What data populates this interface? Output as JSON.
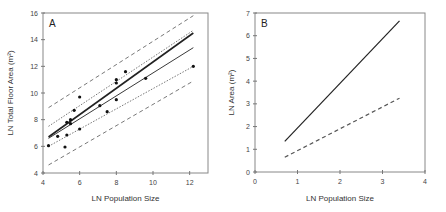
{
  "chart_data": [
    {
      "panel": "A",
      "type": "scatter",
      "title": "",
      "panel_label": "A",
      "xlabel": "LN Population Size",
      "ylabel": "LN Total Floor Area (m²)",
      "xlim": [
        4,
        13
      ],
      "ylim": [
        4,
        16
      ],
      "xticks": [
        4,
        6,
        8,
        10,
        12
      ],
      "yticks": [
        4,
        6,
        8,
        10,
        12,
        14,
        16
      ],
      "grid": false,
      "points": [
        {
          "x": 4.3,
          "y": 6.05
        },
        {
          "x": 4.8,
          "y": 6.75
        },
        {
          "x": 5.2,
          "y": 5.95
        },
        {
          "x": 5.3,
          "y": 6.85
        },
        {
          "x": 5.3,
          "y": 7.8
        },
        {
          "x": 5.5,
          "y": 7.7
        },
        {
          "x": 5.5,
          "y": 8.0
        },
        {
          "x": 5.7,
          "y": 8.7
        },
        {
          "x": 6.0,
          "y": 9.7
        },
        {
          "x": 6.0,
          "y": 7.3
        },
        {
          "x": 7.1,
          "y": 9.05
        },
        {
          "x": 7.5,
          "y": 8.6
        },
        {
          "x": 8.0,
          "y": 11.0
        },
        {
          "x": 8.0,
          "y": 10.75
        },
        {
          "x": 8.0,
          "y": 9.5
        },
        {
          "x": 8.5,
          "y": 11.6
        },
        {
          "x": 9.6,
          "y": 11.1
        },
        {
          "x": 12.2,
          "y": 12.0
        }
      ],
      "series": [
        {
          "name": "fit (thick solid)",
          "style": "solid",
          "width": 1.6,
          "x": [
            4.3,
            12.2
          ],
          "y": [
            6.7,
            14.5
          ]
        },
        {
          "name": "fit (thin solid)",
          "style": "solid",
          "width": 0.9,
          "x": [
            4.3,
            12.2
          ],
          "y": [
            6.6,
            13.4
          ]
        },
        {
          "name": "confidence upper",
          "style": "dotted",
          "width": 0.8,
          "x": [
            4.3,
            12.2
          ],
          "y": [
            7.5,
            14.7
          ]
        },
        {
          "name": "confidence lower",
          "style": "dotted",
          "width": 0.8,
          "x": [
            4.3,
            12.2
          ],
          "y": [
            6.0,
            12.0
          ]
        },
        {
          "name": "prediction upper",
          "style": "dashed",
          "width": 0.8,
          "x": [
            4.3,
            12.2
          ],
          "y": [
            8.9,
            15.8
          ]
        },
        {
          "name": "prediction lower",
          "style": "dashed",
          "width": 0.8,
          "x": [
            4.3,
            12.2
          ],
          "y": [
            4.6,
            10.9
          ]
        }
      ]
    },
    {
      "panel": "B",
      "type": "line",
      "title": "",
      "panel_label": "B",
      "xlabel": "LN Population Size",
      "ylabel": "LN Area (m²)",
      "xlim": [
        0,
        4
      ],
      "ylim": [
        0,
        7
      ],
      "xticks": [
        0,
        1,
        2,
        3,
        4
      ],
      "yticks": [
        0,
        1,
        2,
        3,
        4,
        5,
        6,
        7
      ],
      "grid": false,
      "series": [
        {
          "name": "solid line",
          "style": "solid",
          "width": 1.2,
          "x": [
            0.7,
            3.4
          ],
          "y": [
            1.35,
            6.65
          ]
        },
        {
          "name": "dashed line",
          "style": "dashed",
          "width": 1.2,
          "x": [
            0.7,
            3.4
          ],
          "y": [
            0.65,
            3.25
          ]
        }
      ]
    }
  ]
}
